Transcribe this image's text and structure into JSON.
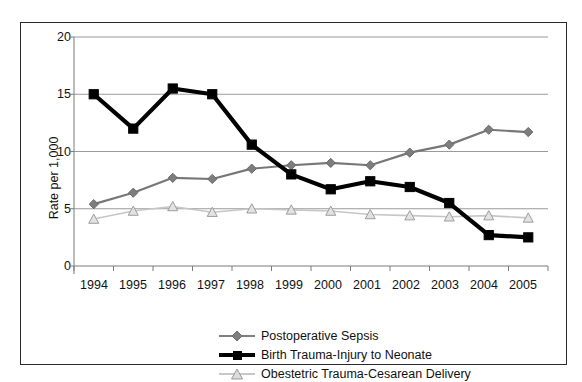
{
  "chart_data": {
    "type": "line",
    "title": "",
    "subtitle": "",
    "xlabel": "",
    "ylabel": "Rate per 1,000",
    "categories": [
      "1994",
      "1995",
      "1996",
      "1997",
      "1998",
      "1999",
      "2000",
      "2001",
      "2002",
      "2003",
      "2004",
      "2005"
    ],
    "x": [
      1994,
      1995,
      1996,
      1997,
      1998,
      1999,
      2000,
      2001,
      2002,
      2003,
      2004,
      2005
    ],
    "ylim": [
      0,
      20
    ],
    "yticks": [
      0,
      5,
      10,
      15,
      20
    ],
    "ytick_labels": [
      "0",
      "5",
      "10",
      "15",
      "20"
    ],
    "grid": "horizontal",
    "legend_position": "bottom-center",
    "series": [
      {
        "name": "Postoperative Sepsis",
        "marker": "diamond",
        "color": "#808080",
        "values": [
          5.4,
          6.4,
          7.7,
          7.6,
          8.5,
          8.8,
          9.0,
          8.8,
          9.9,
          10.6,
          11.9,
          11.7
        ]
      },
      {
        "name": "Birth Trauma-Injury to Neonate",
        "marker": "square",
        "color": "#000000",
        "values": [
          15.0,
          12.0,
          15.5,
          15.0,
          10.6,
          8.0,
          6.7,
          7.4,
          6.9,
          5.5,
          2.7,
          2.5
        ]
      },
      {
        "name": "Obestetric Trauma-Cesarean Delivery",
        "marker": "triangle",
        "color": "#bfbfbf",
        "values": [
          4.1,
          4.8,
          5.2,
          4.7,
          5.0,
          4.9,
          4.8,
          4.5,
          4.4,
          4.3,
          4.4,
          4.2
        ]
      }
    ]
  },
  "axis": {
    "y_title": "Rate per 1,000",
    "y_ticks": [
      "20",
      "15",
      "10",
      "5",
      "0"
    ],
    "x_ticks": [
      "1994",
      "1995",
      "1996",
      "1997",
      "1998",
      "1999",
      "2000",
      "2001",
      "2002",
      "2003",
      "2004",
      "2005"
    ]
  },
  "legend": {
    "items": [
      {
        "label": "Postoperative Sepsis",
        "marker": "diamond-marker",
        "color": "#808080"
      },
      {
        "label": "Birth Trauma-Injury to Neonate",
        "marker": "square-marker",
        "color": "#000000"
      },
      {
        "label": "Obestetric Trauma-Cesarean Delivery",
        "marker": "triangle-marker",
        "color": "#bfbfbf"
      }
    ]
  },
  "colors": {
    "frame_border": "#2b2b2b",
    "gridline": "#9a9a9a",
    "axis_line": "#7a7a7a",
    "background": "#ffffff",
    "text": "#111111"
  }
}
